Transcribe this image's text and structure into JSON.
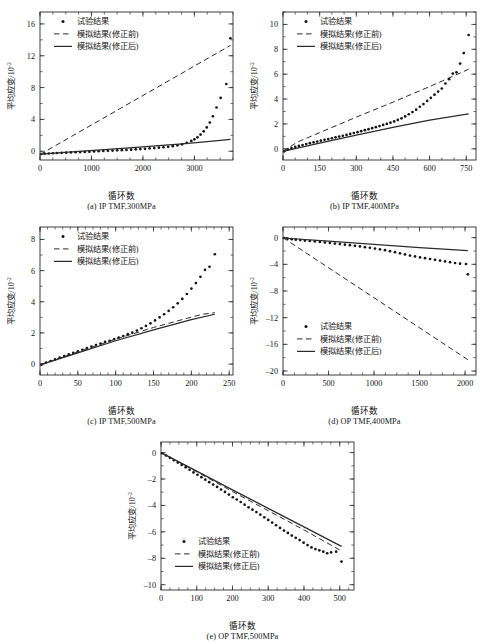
{
  "figure": {
    "background": "#ffffff",
    "ink": "#141414",
    "common": {
      "xlabel": "循环数",
      "ylabel_main": "平均应变/10",
      "ylabel_exp": "-2",
      "legend": [
        {
          "key": "expt",
          "label": "试验结果",
          "marker": "dot"
        },
        {
          "key": "before",
          "label": "模拟结果(修正前)",
          "marker": "dashed-line"
        },
        {
          "key": "after",
          "label": "模拟结果(修正后)",
          "marker": "solid-line"
        }
      ]
    }
  },
  "chart_data": [
    {
      "id": "a",
      "type": "scatter",
      "caption": "(a) IP TMF,300MPa",
      "title": "",
      "xlabel": "循环数",
      "ylabel": "平均应变/10⁻²",
      "xlim": [
        0,
        3750
      ],
      "ylim": [
        -1.1,
        17.5
      ],
      "xticks": [
        0,
        1000,
        2000,
        3000
      ],
      "xminor_step": 250,
      "yticks": [
        0,
        4,
        8,
        12,
        16
      ],
      "yminor_step": 2,
      "grid": false,
      "legend_position": "top-left",
      "series": [
        {
          "name": "试验结果",
          "style": "dots",
          "x": [
            20,
            90,
            170,
            250,
            330,
            420,
            510,
            600,
            690,
            780,
            870,
            960,
            1050,
            1140,
            1230,
            1320,
            1410,
            1500,
            1590,
            1680,
            1770,
            1860,
            1950,
            2040,
            2130,
            2220,
            2310,
            2400,
            2490,
            2580,
            2670,
            2760,
            2850,
            2940,
            3000,
            3060,
            3120,
            3180,
            3240,
            3300,
            3360,
            3430,
            3510,
            3620,
            3700
          ],
          "y": [
            -0.35,
            -0.3,
            -0.28,
            -0.25,
            -0.22,
            -0.2,
            -0.18,
            -0.15,
            -0.12,
            -0.1,
            -0.08,
            -0.05,
            -0.02,
            0.0,
            0.03,
            0.06,
            0.08,
            0.11,
            0.14,
            0.17,
            0.2,
            0.24,
            0.27,
            0.31,
            0.35,
            0.4,
            0.45,
            0.5,
            0.56,
            0.64,
            0.74,
            0.87,
            1.05,
            1.3,
            1.5,
            1.75,
            2.1,
            2.5,
            3.0,
            3.6,
            4.4,
            5.5,
            6.7,
            8.45,
            14.2
          ]
        },
        {
          "name": "模拟结果(修正前)",
          "style": "dashed",
          "x": [
            0,
            3700
          ],
          "y": [
            -0.4,
            13.3
          ]
        },
        {
          "name": "模拟结果(修正后)",
          "style": "solid",
          "x": [
            0,
            900,
            1800,
            2700,
            3200,
            3700
          ],
          "y": [
            -0.35,
            0.05,
            0.45,
            0.9,
            1.18,
            1.5
          ]
        }
      ]
    },
    {
      "id": "b",
      "type": "scatter",
      "caption": "(b) IP TMF,400MPa",
      "title": "",
      "xlabel": "循环数",
      "ylabel": "平均应变/10⁻²",
      "xlim": [
        0,
        790
      ],
      "ylim": [
        -0.9,
        11.0
      ],
      "xticks": [
        0,
        150,
        300,
        450,
        600,
        750
      ],
      "xminor_step": 50,
      "yticks": [
        0,
        2,
        4,
        6,
        8,
        10
      ],
      "yminor_step": 1,
      "grid": false,
      "legend_position": "top-left",
      "series": [
        {
          "name": "试验结果",
          "style": "dots",
          "x": [
            5,
            20,
            35,
            50,
            65,
            80,
            95,
            110,
            125,
            140,
            155,
            170,
            185,
            200,
            215,
            230,
            245,
            260,
            275,
            290,
            305,
            320,
            335,
            350,
            365,
            380,
            395,
            410,
            425,
            440,
            455,
            470,
            485,
            500,
            515,
            530,
            545,
            560,
            575,
            590,
            605,
            620,
            635,
            650,
            665,
            680,
            695,
            710,
            725,
            740,
            760
          ],
          "y": [
            -0.2,
            -0.05,
            0.05,
            0.15,
            0.23,
            0.3,
            0.38,
            0.45,
            0.52,
            0.58,
            0.65,
            0.72,
            0.78,
            0.85,
            0.92,
            0.98,
            1.05,
            1.12,
            1.2,
            1.27,
            1.34,
            1.42,
            1.5,
            1.58,
            1.66,
            1.74,
            1.83,
            1.92,
            2.0,
            2.1,
            2.2,
            2.32,
            2.45,
            2.6,
            2.78,
            2.95,
            3.15,
            3.38,
            3.6,
            3.85,
            4.1,
            4.35,
            4.6,
            4.85,
            5.25,
            5.6,
            6.05,
            6.15,
            6.85,
            7.7,
            9.15
          ]
        },
        {
          "name": "模拟结果(修正前)",
          "style": "dashed",
          "x": [
            0,
            60,
            150,
            300,
            450,
            600,
            760
          ],
          "y": [
            -0.2,
            0.55,
            1.3,
            2.55,
            3.75,
            5.0,
            6.4
          ]
        },
        {
          "name": "模拟结果(修正后)",
          "style": "solid",
          "x": [
            0,
            150,
            300,
            450,
            600,
            760
          ],
          "y": [
            -0.2,
            0.45,
            1.1,
            1.72,
            2.3,
            2.8
          ]
        }
      ]
    },
    {
      "id": "c",
      "type": "scatter",
      "caption": "(c) IP TMF,500MPa",
      "title": "",
      "xlabel": "循环数",
      "ylabel": "平均应变/10⁻²",
      "xlim": [
        0,
        255
      ],
      "ylim": [
        -0.7,
        8.8
      ],
      "xticks": [
        0,
        50,
        100,
        150,
        200,
        250
      ],
      "xminor_step": 10,
      "yticks": [
        0,
        2,
        4,
        6,
        8
      ],
      "yminor_step": 1,
      "grid": false,
      "legend_position": "top-left",
      "series": [
        {
          "name": "试验结果",
          "style": "dots",
          "x": [
            2,
            8,
            14,
            20,
            26,
            32,
            38,
            44,
            50,
            56,
            62,
            68,
            74,
            80,
            86,
            92,
            98,
            104,
            110,
            116,
            122,
            128,
            134,
            140,
            146,
            152,
            158,
            164,
            170,
            176,
            182,
            188,
            194,
            200,
            206,
            212,
            218,
            224,
            231
          ],
          "y": [
            -0.05,
            0.1,
            0.2,
            0.3,
            0.42,
            0.52,
            0.62,
            0.72,
            0.82,
            0.92,
            1.02,
            1.12,
            1.22,
            1.32,
            1.42,
            1.5,
            1.6,
            1.7,
            1.8,
            1.92,
            2.02,
            2.15,
            2.3,
            2.45,
            2.62,
            2.8,
            3.0,
            3.2,
            3.42,
            3.65,
            3.9,
            4.18,
            4.5,
            4.85,
            5.2,
            5.6,
            6.05,
            6.25,
            7.05
          ]
        },
        {
          "name": "模拟结果(修正前)",
          "style": "dashed",
          "x": [
            0,
            50,
            100,
            150,
            195,
            215,
            231
          ],
          "y": [
            -0.05,
            0.78,
            1.6,
            2.35,
            2.95,
            3.2,
            3.3
          ]
        },
        {
          "name": "模拟结果(修正后)",
          "style": "solid",
          "x": [
            0,
            50,
            100,
            150,
            200,
            231
          ],
          "y": [
            -0.05,
            0.72,
            1.5,
            2.2,
            2.85,
            3.2
          ]
        }
      ]
    },
    {
      "id": "d",
      "type": "scatter",
      "caption": "(d) OP TMF,400MPa",
      "title": "",
      "xlabel": "循环数",
      "ylabel": "平均应变/10⁻²",
      "xlim": [
        0,
        2120
      ],
      "ylim": [
        -20.6,
        1.6
      ],
      "xticks": [
        0,
        500,
        1000,
        1500,
        2000
      ],
      "xminor_step": 125,
      "yticks": [
        0,
        -4,
        -8,
        -12,
        -16,
        -20
      ],
      "yminor_step": 2,
      "grid": false,
      "legend_position": "bottom-left",
      "series": [
        {
          "name": "试验结果",
          "style": "dots",
          "x": [
            10,
            50,
            95,
            140,
            190,
            240,
            295,
            350,
            405,
            460,
            515,
            570,
            625,
            680,
            735,
            790,
            845,
            900,
            955,
            1010,
            1065,
            1120,
            1175,
            1230,
            1285,
            1340,
            1395,
            1450,
            1505,
            1560,
            1615,
            1670,
            1725,
            1780,
            1835,
            1890,
            1945,
            2010,
            2030
          ],
          "y": [
            -0.05,
            -0.15,
            -0.22,
            -0.3,
            -0.36,
            -0.43,
            -0.5,
            -0.57,
            -0.64,
            -0.72,
            -0.8,
            -0.88,
            -0.96,
            -1.05,
            -1.13,
            -1.22,
            -1.32,
            -1.42,
            -1.52,
            -1.63,
            -1.75,
            -1.88,
            -2.02,
            -2.18,
            -2.35,
            -2.52,
            -2.68,
            -2.82,
            -2.96,
            -3.08,
            -3.2,
            -3.32,
            -3.44,
            -3.56,
            -3.68,
            -3.8,
            -3.9,
            -3.95,
            -5.5
          ]
        },
        {
          "name": "模拟结果(修正前)",
          "style": "dashed",
          "x": [
            0,
            2030
          ],
          "y": [
            0.0,
            -18.3
          ]
        },
        {
          "name": "模拟结果(修正后)",
          "style": "solid",
          "x": [
            0,
            500,
            1000,
            1500,
            2030
          ],
          "y": [
            -0.05,
            -0.52,
            -1.0,
            -1.48,
            -1.95
          ]
        }
      ]
    },
    {
      "id": "e",
      "type": "scatter",
      "caption": "(e) OP TMF,500MPa",
      "title": "",
      "xlabel": "循环数",
      "ylabel": "平均应变/10⁻²",
      "xlim": [
        0,
        540
      ],
      "ylim": [
        -10.4,
        0.8
      ],
      "xticks": [
        0,
        100,
        200,
        300,
        400,
        500
      ],
      "xminor_step": 25,
      "yticks": [
        0,
        -2,
        -4,
        -6,
        -8,
        -10
      ],
      "yminor_step": 1,
      "grid": false,
      "legend_position": "bottom-left",
      "series": [
        {
          "name": "试验结果",
          "style": "dots",
          "x": [
            3,
            14,
            25,
            36,
            47,
            58,
            69,
            80,
            91,
            102,
            113,
            124,
            135,
            146,
            157,
            168,
            179,
            190,
            201,
            212,
            223,
            234,
            245,
            256,
            267,
            278,
            289,
            300,
            311,
            322,
            333,
            344,
            355,
            366,
            377,
            388,
            399,
            410,
            421,
            432,
            443,
            454,
            465,
            476,
            490,
            505
          ],
          "y": [
            -0.05,
            -0.22,
            -0.4,
            -0.58,
            -0.76,
            -0.94,
            -1.12,
            -1.3,
            -1.5,
            -1.68,
            -1.86,
            -2.05,
            -2.24,
            -2.42,
            -2.6,
            -2.8,
            -2.98,
            -3.18,
            -3.38,
            -3.55,
            -3.74,
            -3.94,
            -4.14,
            -4.32,
            -4.5,
            -4.7,
            -4.9,
            -5.1,
            -5.3,
            -5.5,
            -5.7,
            -5.9,
            -6.08,
            -6.28,
            -6.45,
            -6.62,
            -6.82,
            -7.0,
            -7.18,
            -7.3,
            -7.4,
            -7.5,
            -7.62,
            -7.55,
            -7.5,
            -8.25
          ]
        },
        {
          "name": "模拟结果(修正前)",
          "style": "dashed",
          "x": [
            0,
            100,
            200,
            300,
            400,
            505
          ],
          "y": [
            0.0,
            -1.45,
            -2.95,
            -4.4,
            -5.85,
            -7.45
          ]
        },
        {
          "name": "模拟结果(修正后)",
          "style": "solid",
          "x": [
            0,
            100,
            200,
            300,
            400,
            505
          ],
          "y": [
            0.0,
            -1.4,
            -2.82,
            -4.22,
            -5.62,
            -7.1
          ]
        }
      ]
    }
  ]
}
